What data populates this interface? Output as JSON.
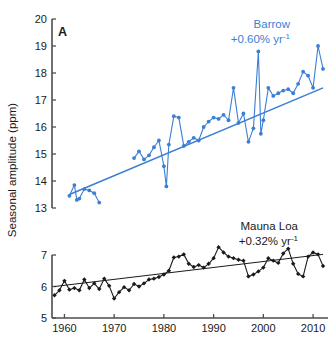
{
  "figure": {
    "panel_letter": "A",
    "ylabel": "Seasonal amplitude (ppm)",
    "colors": {
      "barrow": "#3a7fd5",
      "mauna_loa": "#1a1a1a",
      "axis": "#4d4d4d",
      "background": "#ffffff"
    }
  },
  "annotations": {
    "barrow": {
      "name": "Barrow",
      "trend": "+0.60% yr",
      "trend_exponent": "-1"
    },
    "mauna_loa": {
      "name": "Mauna Loa",
      "trend": "+0.32% yr",
      "trend_exponent": "-1"
    }
  },
  "axes": {
    "x": {
      "label": "",
      "ticks": [
        1960,
        1970,
        1980,
        1990,
        2000,
        2010
      ],
      "tick_labels": [
        "1960",
        "1970",
        "1980",
        "1990",
        "2000",
        "2010"
      ],
      "range": [
        1957.5,
        2013.0
      ]
    },
    "y_upper": {
      "ticks": [
        13,
        14,
        15,
        16,
        17,
        18,
        19,
        20
      ],
      "tick_labels": [
        "13",
        "14",
        "15",
        "16",
        "17",
        "18",
        "19",
        "20"
      ],
      "range": [
        13,
        20
      ]
    },
    "y_lower": {
      "ticks": [
        5,
        6,
        7
      ],
      "tick_labels": [
        "5",
        "6",
        "7"
      ],
      "range": [
        5,
        7
      ]
    }
  },
  "chart_data": {
    "type": "line",
    "title": "",
    "subtitle": "",
    "xlabel": "",
    "ylabel": "Seasonal amplitude (ppm)",
    "broken_axis": true,
    "grid": false,
    "legend_position": "inline-annotation",
    "xlim": [
      1957.5,
      2013.0
    ],
    "ylim_upper": [
      13,
      20
    ],
    "ylim_lower": [
      5,
      7
    ],
    "series": [
      {
        "name": "Barrow",
        "color": "#3a7fd5",
        "panel": "upper",
        "trend_percent_per_year": 0.6,
        "trend_label": "+0.60% yr-1",
        "marker": "filled-circle",
        "x": [
          1961,
          1962,
          1962.5,
          1963,
          1964,
          1965,
          1966,
          1967,
          1974,
          1975,
          1976,
          1977,
          1978,
          1979,
          1980,
          1980.5,
          1981,
          1982,
          1983,
          1984,
          1985,
          1986,
          1987,
          1988,
          1989,
          1990,
          1991,
          1992,
          1993,
          1994,
          1995,
          1996,
          1997,
          1998,
          1999,
          1999.5,
          2000,
          2001,
          2002,
          2003,
          2004,
          2005,
          2006,
          2007,
          2008,
          2009,
          2010,
          2011,
          2012
        ],
        "y": [
          13.45,
          13.85,
          13.3,
          13.35,
          13.7,
          13.65,
          13.55,
          13.2,
          14.85,
          15.1,
          14.8,
          14.95,
          15.25,
          15.5,
          14.55,
          13.8,
          15.35,
          16.4,
          16.35,
          15.3,
          15.45,
          15.6,
          15.5,
          16.0,
          16.2,
          16.35,
          16.3,
          16.45,
          16.25,
          17.45,
          16.15,
          16.5,
          15.45,
          15.95,
          18.8,
          15.75,
          16.25,
          17.45,
          17.15,
          17.25,
          17.35,
          17.4,
          17.25,
          17.6,
          18.05,
          17.9,
          17.45,
          19.0,
          18.15
        ],
        "trend_line": {
          "x": [
            1961,
            2012
          ],
          "y": [
            13.5,
            17.45
          ]
        }
      },
      {
        "name": "Mauna Loa",
        "color": "#1a1a1a",
        "panel": "lower",
        "trend_percent_per_year": 0.32,
        "trend_label": "+0.32% yr-1",
        "marker": "filled-diamond",
        "x": [
          1958,
          1959,
          1960,
          1961,
          1962,
          1963,
          1964,
          1965,
          1966,
          1967,
          1968,
          1969,
          1970,
          1971,
          1972,
          1973,
          1974,
          1975,
          1976,
          1977,
          1978,
          1979,
          1980,
          1981,
          1982,
          1983,
          1984,
          1985,
          1986,
          1987,
          1988,
          1989,
          1990,
          1991,
          1992,
          1993,
          1994,
          1995,
          1996,
          1997,
          1998,
          1999,
          2000,
          2001,
          2002,
          2003,
          2004,
          2005,
          2006,
          2007,
          2008,
          2009,
          2010,
          2011,
          2012
        ],
        "y": [
          5.72,
          5.88,
          6.18,
          5.9,
          5.95,
          5.88,
          6.22,
          5.95,
          6.1,
          5.92,
          6.25,
          6.02,
          5.62,
          5.82,
          5.98,
          5.88,
          6.08,
          6.0,
          6.1,
          6.22,
          6.25,
          6.3,
          6.38,
          6.5,
          6.92,
          6.95,
          7.02,
          6.72,
          6.62,
          6.68,
          6.6,
          6.72,
          6.9,
          7.25,
          7.08,
          6.95,
          6.9,
          6.85,
          6.82,
          6.32,
          6.38,
          6.48,
          6.6,
          6.9,
          6.82,
          6.75,
          7.05,
          7.2,
          6.72,
          6.4,
          6.32,
          6.95,
          7.08,
          7.02,
          6.65
        ],
        "trend_line": {
          "x": [
            1958,
            2012
          ],
          "y": [
            6.0,
            7.02
          ]
        }
      }
    ]
  }
}
